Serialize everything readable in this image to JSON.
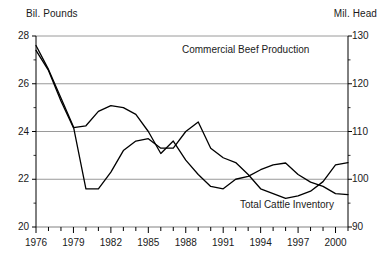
{
  "axes": {
    "left_unit": "Bil. Pounds",
    "right_unit": "Mil. Head",
    "left_ticks": [
      "28",
      "26",
      "24",
      "22",
      "20"
    ],
    "right_ticks": [
      "130",
      "120",
      "110",
      "100",
      "90"
    ],
    "x_ticks": [
      "1976",
      "1979",
      "1982",
      "1985",
      "1988",
      "1991",
      "1994",
      "1997",
      "2000"
    ]
  },
  "labels": {
    "beef": "Commercial Beef Production",
    "inventory": "Total Cattle Inventory"
  },
  "colors": {
    "line": "#000000",
    "grid": "#808080",
    "axis": "#000000",
    "background": "#ffffff"
  },
  "chart_data": {
    "type": "line",
    "title": "",
    "xlabel": "",
    "ylabel": "Bil. Pounds",
    "y2label": "Mil. Head",
    "ylim": [
      20,
      28
    ],
    "y2lim": [
      90,
      130
    ],
    "xlim": [
      1976,
      2001
    ],
    "grid": true,
    "legend": "inline-annotations",
    "yticks": [
      20,
      22,
      24,
      26,
      28
    ],
    "y2ticks": [
      90,
      100,
      110,
      120,
      130
    ],
    "xticks": [
      1976,
      1979,
      1982,
      1985,
      1988,
      1991,
      1994,
      1997,
      2000
    ],
    "x": [
      1976,
      1977,
      1978,
      1979,
      1980,
      1981,
      1982,
      1983,
      1984,
      1985,
      1986,
      1987,
      1988,
      1989,
      1990,
      1991,
      1992,
      1993,
      1994,
      1995,
      1996,
      1997,
      1998,
      1999,
      2000,
      2001
    ],
    "series": [
      {
        "name": "Commercial Beef Production",
        "axis": "left",
        "unit": "Bil. Pounds",
        "values": [
          27.6,
          26.6,
          25.4,
          24.2,
          21.6,
          21.6,
          22.3,
          23.2,
          23.6,
          23.7,
          23.3,
          23.3,
          24.0,
          24.4,
          23.3,
          22.9,
          22.7,
          22.2,
          21.6,
          21.4,
          21.2,
          21.3,
          21.5,
          21.9,
          22.6,
          22.7
        ]
      },
      {
        "name": "Total Cattle Inventory",
        "axis": "right",
        "unit": "Mil. Head",
        "values": [
          127.0,
          122.8,
          116.4,
          110.8,
          111.2,
          114.2,
          115.4,
          115.0,
          113.6,
          110.0,
          105.4,
          108.0,
          104.0,
          101.0,
          98.5,
          98.0,
          100.0,
          100.6,
          102.0,
          103.0,
          103.4,
          101.0,
          99.4,
          98.5,
          97.0,
          96.8
        ]
      }
    ]
  }
}
